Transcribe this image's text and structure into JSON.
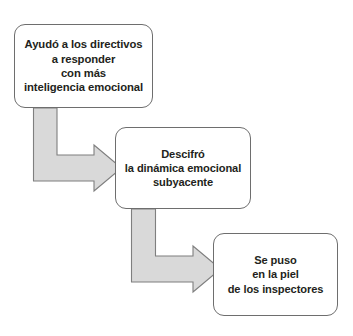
{
  "diagram": {
    "type": "flow-cascade",
    "background_color": "#ffffff",
    "text_color": "#231f20",
    "box_border_color": "#6e6e6e",
    "arrow_fill_color": "#d9d9d9",
    "arrow_border_color": "#7f7f7f",
    "nodes": [
      {
        "id": "node-1",
        "text": "Ayudó a los directivos\na responder\ncon más\ninteligencia emocional",
        "lines": [
          "Ayudó a los directivos",
          "a responder",
          "con más",
          "inteligencia emocional"
        ]
      },
      {
        "id": "node-2",
        "text": "Descifró\nla dinámica emocional\nsubyacente",
        "lines": [
          "Descifró",
          "la dinámica emocional",
          "subyacente"
        ]
      },
      {
        "id": "node-3",
        "text": "Se puso\nen la piel\nde los inspectores",
        "lines": [
          "Se puso",
          "en la piel",
          "de los inspectores"
        ]
      }
    ],
    "connectors": [
      {
        "id": "connector-1",
        "from": "node-1",
        "to": "node-2",
        "shape": "bent-arrow-down-right"
      },
      {
        "id": "connector-2",
        "from": "node-2",
        "to": "node-3",
        "shape": "bent-arrow-down-right"
      }
    ]
  }
}
